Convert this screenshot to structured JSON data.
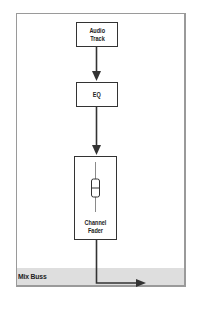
{
  "diagram": {
    "nodes": [
      {
        "id": "audio-track",
        "label_line1": "Audio",
        "label_line2": "Track"
      },
      {
        "id": "eq",
        "label": "EQ"
      },
      {
        "id": "channel-fader",
        "label_line1": "Channel",
        "label_line2": "Fader"
      }
    ],
    "bus": {
      "label": "Mix Buss"
    },
    "edges": [
      {
        "from": "audio-track",
        "to": "eq"
      },
      {
        "from": "eq",
        "to": "channel-fader"
      },
      {
        "from": "channel-fader",
        "to": "mix-buss"
      }
    ],
    "colors": {
      "frame_border": "#9a9a9a",
      "bus_fill": "#dedede",
      "stroke": "#333333",
      "text": "#222222"
    }
  }
}
